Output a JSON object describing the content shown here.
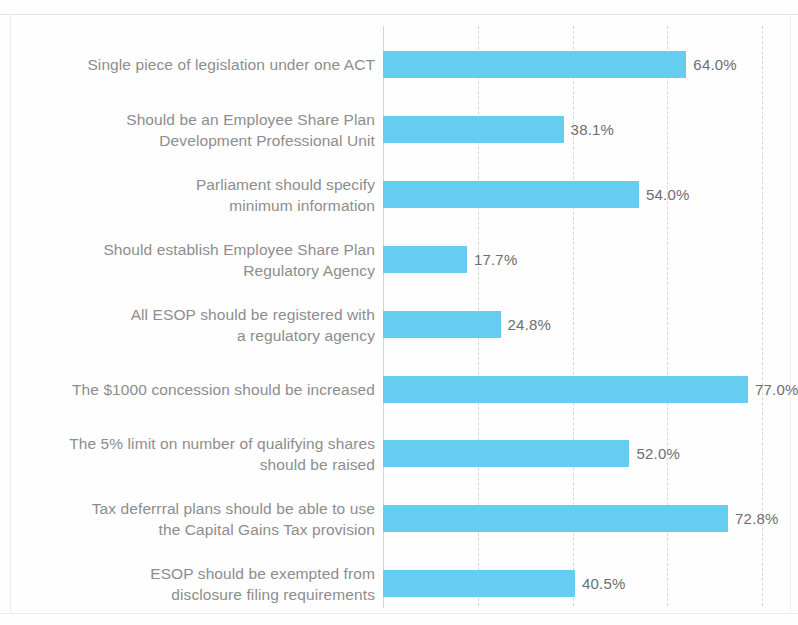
{
  "chart_data": {
    "type": "bar",
    "orientation": "horizontal",
    "title": "",
    "subtitle": "",
    "xlabel": "",
    "ylabel": "",
    "xlim": [
      0,
      80
    ],
    "xticks": [
      0,
      20,
      40,
      60,
      80
    ],
    "grid": true,
    "grid_style": "dashed-vertical",
    "legend": false,
    "value_label_suffix": "%",
    "bar_color": "#64cdf0",
    "label_color": "#8d8d8d",
    "value_color": "#6e6e6e",
    "gridline_color": "#d7d7d7",
    "categories": [
      "Single piece of legislation under one ACT",
      "Should be an Employee Share Plan\nDevelopment Professional Unit",
      "Parliament should specify\nminimum information",
      "Should establish Employee Share Plan\nRegulatory Agency",
      "All ESOP should be registered with\na regulatory agency",
      "The $1000 concession should be increased",
      "The 5% limit on number of qualifying shares\nshould be raised",
      "Tax deferrral plans should be able to use\nthe Capital Gains Tax provision",
      "ESOP should be exempted from\ndisclosure filing requirements"
    ],
    "values": [
      64.0,
      38.1,
      54.0,
      17.7,
      24.8,
      77.0,
      52.0,
      72.8,
      40.5
    ],
    "value_labels": [
      "64.0%",
      "38.1%",
      "54.0%",
      "17.7%",
      "24.8%",
      "77.0%",
      "52.0%",
      "72.8%",
      "40.5%"
    ]
  }
}
